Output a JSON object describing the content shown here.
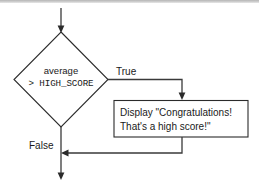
{
  "diagram": {
    "type": "flowchart",
    "background_color": "#ffffff",
    "line_color": "#3a3a3a",
    "shape_stroke_color": "#2b2b2b",
    "text_color": "#1a1a1a",
    "top_band_color": "#c9c9c9",
    "nodes": [
      {
        "id": "decision",
        "shape": "diamond",
        "text_lines": [
          "average",
          "> HIGH_SCORE"
        ],
        "line1": "average",
        "line2": "> HIGH_SCORE"
      },
      {
        "id": "process",
        "shape": "rectangle",
        "text_lines": [
          "Display \"Congratulations!",
          "That's a high score!\""
        ],
        "line1": "Display \"Congratulations!",
        "line2": "That's a high score!\""
      }
    ],
    "edges": [
      {
        "id": "entry",
        "from": "",
        "to": "decision",
        "label": ""
      },
      {
        "id": "true-branch",
        "from": "decision",
        "to": "process",
        "label": "True"
      },
      {
        "id": "false-branch",
        "from": "decision",
        "to": "exit",
        "label": "False"
      },
      {
        "id": "merge",
        "from": "process",
        "to": "exit",
        "label": ""
      }
    ],
    "labels": {
      "true": "True",
      "false": "False"
    }
  }
}
